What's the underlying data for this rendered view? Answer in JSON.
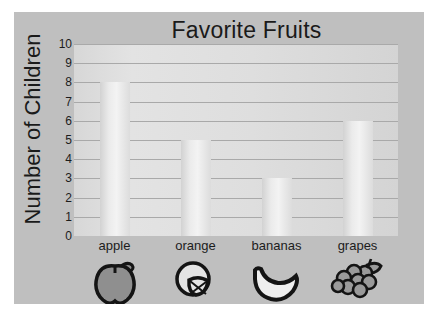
{
  "chart_data": {
    "type": "bar",
    "title": "Favorite Fruits",
    "xlabel": "",
    "ylabel": "Number of Children",
    "categories": [
      "apple",
      "orange",
      "bananas",
      "grapes"
    ],
    "values": [
      8,
      5,
      3,
      6
    ],
    "ylim": [
      0,
      10
    ],
    "y_ticks": [
      "0",
      "1",
      "2",
      "3",
      "4",
      "5",
      "6",
      "7",
      "8",
      "9",
      "10"
    ],
    "grid": true,
    "legend": "none",
    "icons": [
      "apple-icon",
      "orange-icon",
      "banana-icon",
      "grapes-icon"
    ],
    "colors": {
      "canvas_background": "#bfbfbf",
      "plot_background": "#dedede",
      "bar_fill": "#ebebeb",
      "gridline": "#a9a9a9",
      "text": "#1a1a1a",
      "icon_outline": "#141414",
      "apple_fill": "#8f8f8f",
      "orange_fill": "#e4e4e4",
      "banana_fill": "#eeeeee",
      "grapes_fill": "#9a9a9a"
    }
  }
}
